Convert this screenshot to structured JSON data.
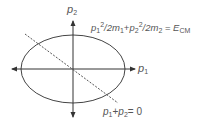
{
  "diagram": {
    "axes": {
      "x_label": {
        "base": "p",
        "sub": "1"
      },
      "y_label": {
        "base": "p",
        "sub": "2"
      }
    },
    "ellipse_label": {
      "t1": "p",
      "t1_sub": "1",
      "t1_sup": "2",
      "t1_rest": "/2m",
      "t1_m_sub": "1",
      "plus": "+",
      "t2": "p",
      "t2_sub": "2",
      "t2_sup": "2",
      "t2_rest": "/2m",
      "t2_m_sub": "2",
      "eq": " = ",
      "rhs": "E",
      "rhs_sub": "CM"
    },
    "line_label": {
      "a": "p",
      "a_sub": "1",
      "plus": "+",
      "b": "p",
      "b_sub": "2",
      "eq": "= 0"
    },
    "colors": {
      "stroke": "#444444",
      "text": "#555555"
    }
  }
}
